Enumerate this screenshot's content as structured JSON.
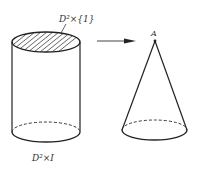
{
  "diagram": {
    "labels": {
      "top_disk": "D²×{1}",
      "cylinder": "D²×I",
      "apex": "A"
    },
    "colors": {
      "stroke": "#222222",
      "text": "#333333",
      "arrow": "#444444"
    }
  }
}
